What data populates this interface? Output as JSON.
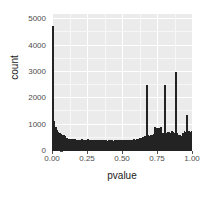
{
  "chart_data": {
    "type": "bar",
    "subtype": "histogram",
    "title": "",
    "xlabel": "pvalue",
    "ylabel": "count",
    "xlim": [
      0.0,
      1.0
    ],
    "ylim": [
      0,
      5200
    ],
    "grid": true,
    "legend": null,
    "bin_width": 0.01,
    "panel_background": "#ebebeb",
    "grid_color": "#ffffff",
    "bar_color": "#232323",
    "x_ticks": [
      "0.00",
      "0.25",
      "0.50",
      "0.75",
      "1.00"
    ],
    "x_tick_values": [
      0.0,
      0.25,
      0.5,
      0.75,
      1.0
    ],
    "y_ticks": [
      "0",
      "1000",
      "2000",
      "3000",
      "4000",
      "5000"
    ],
    "y_tick_values": [
      0,
      1000,
      2000,
      3000,
      4000,
      5000
    ],
    "x": [
      0.005,
      0.015,
      0.025,
      0.035,
      0.045,
      0.055,
      0.065,
      0.075,
      0.085,
      0.095,
      0.105,
      0.115,
      0.125,
      0.135,
      0.145,
      0.155,
      0.165,
      0.175,
      0.185,
      0.195,
      0.205,
      0.215,
      0.225,
      0.235,
      0.245,
      0.255,
      0.265,
      0.275,
      0.285,
      0.295,
      0.305,
      0.315,
      0.325,
      0.335,
      0.345,
      0.355,
      0.365,
      0.375,
      0.385,
      0.395,
      0.405,
      0.415,
      0.425,
      0.435,
      0.445,
      0.455,
      0.465,
      0.475,
      0.485,
      0.495,
      0.505,
      0.515,
      0.525,
      0.535,
      0.545,
      0.555,
      0.565,
      0.575,
      0.585,
      0.595,
      0.605,
      0.615,
      0.625,
      0.635,
      0.645,
      0.655,
      0.665,
      0.675,
      0.685,
      0.695,
      0.705,
      0.715,
      0.725,
      0.735,
      0.745,
      0.755,
      0.765,
      0.775,
      0.785,
      0.795,
      0.805,
      0.815,
      0.825,
      0.835,
      0.845,
      0.855,
      0.865,
      0.875,
      0.885,
      0.895,
      0.905,
      0.915,
      0.925,
      0.935,
      0.945,
      0.955,
      0.965,
      0.975,
      0.985,
      0.995
    ],
    "values": [
      4750,
      1150,
      900,
      780,
      720,
      680,
      650,
      620,
      600,
      580,
      500,
      470,
      455,
      450,
      445,
      440,
      460,
      430,
      425,
      420,
      430,
      440,
      425,
      415,
      410,
      450,
      430,
      420,
      415,
      410,
      420,
      415,
      425,
      405,
      400,
      410,
      405,
      415,
      400,
      395,
      405,
      400,
      410,
      395,
      400,
      405,
      400,
      410,
      405,
      400,
      415,
      410,
      420,
      415,
      425,
      420,
      430,
      425,
      440,
      435,
      470,
      460,
      480,
      500,
      520,
      540,
      560,
      2500,
      600,
      580,
      620,
      600,
      640,
      900,
      880,
      870,
      860,
      900,
      700,
      680,
      2500,
      700,
      720,
      740,
      700,
      760,
      720,
      700,
      3000,
      700,
      620,
      600,
      580,
      700,
      760,
      740,
      1350,
      760,
      740,
      750
    ]
  }
}
